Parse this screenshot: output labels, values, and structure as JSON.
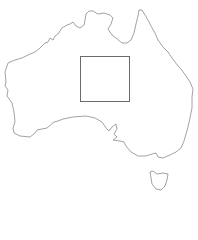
{
  "map": {
    "region": "Australia",
    "outline_color": "#8a8a8a",
    "mainland_path": "M8,63 L5,72 L6,82 L5,86 L8,90 L7,96 L12,103 L14,112 L15,122 L13,128 L14,133 L20,136 L30,137 L35,133 L37,130 L47,128 L54,122 L58,121 L63,119 L73,117 L86,116 L95,118 L102,122 L106,128 L109,131 L112,127 L116,124 L117,129 L114,134 L117,137 L113,140 L120,141 L124,142 L126,146 L131,152 L138,156 L146,156 L152,154 L156,153 L158,157 L163,158 L170,155 L176,152 L181,148 L184,141 L186,134 L188,127 L190,118 L192,108 L192,97 L193,89 L190,82 L186,76 L181,69 L178,66 L175,62 L172,58 L168,52 L163,47 L158,40 L155,33 L151,26 L148,20 L145,15 L142,10 L139,10 L138,16 L136,24 L134,33 L131,40 L127,43 L122,43 L116,38 L112,35 L108,29 L111,24 L113,18 L110,15 L104,13 L98,14 L93,11 L89,11 L86,14 L85,20 L84,25 L80,28 L76,26 L73,22 L70,24 L67,25 L62,28 L58,34 L55,36 L53,40 L50,38 L48,42 L45,43 L40,48 L35,52 L28,55 L22,58 L15,60 L10,62 Z",
    "tasmania_path": "M150,172 L151,178 L152,184 L156,189 L161,190 L165,186 L167,180 L168,174 L163,173 L157,174 L153,171 Z",
    "selection_box": {
      "left": 80,
      "top": 56,
      "width": 50,
      "height": 46,
      "border_color": "#6a6a6a"
    }
  }
}
